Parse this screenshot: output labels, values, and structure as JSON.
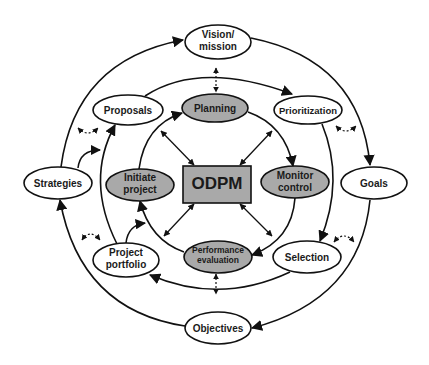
{
  "diagram": {
    "center": {
      "label": "ODPM",
      "fill": "#a9a9a9"
    },
    "colors": {
      "stroke": "#111111",
      "gray_node": "#a9a9a9",
      "white_node": "#ffffff"
    },
    "outer_ring": [
      {
        "id": "vision",
        "lines": [
          "Vision/",
          "mission"
        ]
      },
      {
        "id": "goals",
        "lines": [
          "Goals"
        ]
      },
      {
        "id": "objectives",
        "lines": [
          "Objectives"
        ]
      },
      {
        "id": "strategies",
        "lines": [
          "Strategies"
        ]
      }
    ],
    "middle_ring": [
      {
        "id": "prioritization",
        "lines": [
          "Prioritization"
        ]
      },
      {
        "id": "selection",
        "lines": [
          "Selection"
        ]
      },
      {
        "id": "portfolio",
        "lines": [
          "Project",
          "portfolio"
        ]
      },
      {
        "id": "proposals",
        "lines": [
          "Proposals"
        ]
      }
    ],
    "inner_ring": [
      {
        "id": "planning",
        "lines": [
          "Planning"
        ]
      },
      {
        "id": "monitor",
        "lines": [
          "Monitor",
          "control"
        ]
      },
      {
        "id": "performance",
        "lines": [
          "Performance",
          "evaluation"
        ]
      },
      {
        "id": "initiate",
        "lines": [
          "Initiate",
          "project"
        ]
      }
    ]
  }
}
